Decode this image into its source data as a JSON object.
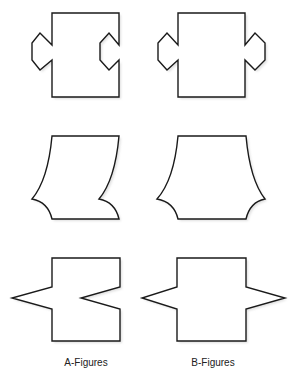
{
  "figure": {
    "columns": [
      {
        "label": "A-Figures",
        "center_x": 86
      },
      {
        "label": "B-Figures",
        "center_x": 213
      }
    ],
    "rows": [
      {
        "row": 1,
        "description": "Rectangles with hexagonal side tabs",
        "A": {
          "left": "outward hexagonal tab",
          "right": "inward hexagonal notch"
        },
        "B": {
          "left": "outward hexagonal tab",
          "right": "outward hexagonal tab"
        }
      },
      {
        "row": 2,
        "description": "Rectangles with concave curved sides and cusps",
        "A": {
          "left": "curved side with cusp pointing outward",
          "right": "curved side with cusp pointing inward"
        },
        "B": {
          "left": "curved side with cusp pointing outward",
          "right": "curved side with cusp pointing outward"
        }
      },
      {
        "row": 3,
        "description": "Rectangles with triangular spikes",
        "A": {
          "left": "outward triangular spike",
          "right": "inward triangular notch"
        },
        "B": {
          "left": "outward triangular spike",
          "right": "outward triangular spike"
        }
      }
    ],
    "colors": {
      "stroke": "#1a1a1a",
      "fill": "#ffffff",
      "shadow": "#c8c8c8",
      "background": "#ffffff"
    }
  }
}
